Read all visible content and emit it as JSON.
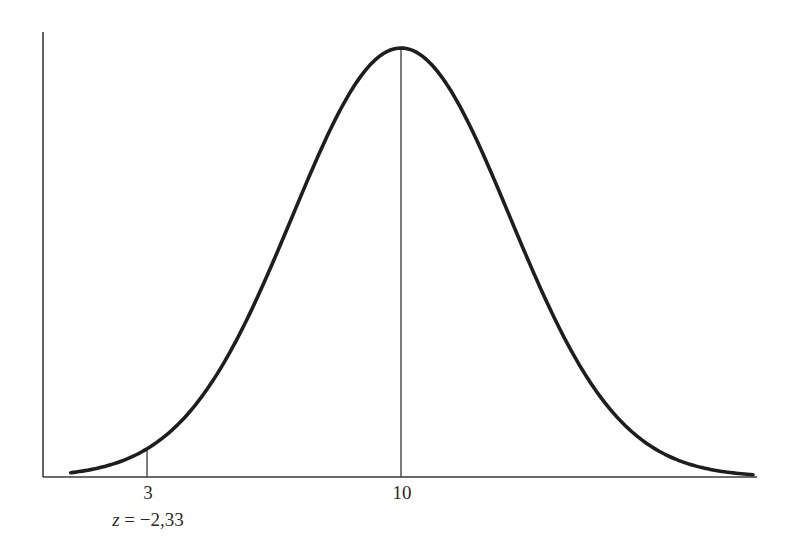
{
  "chart_data": {
    "type": "line",
    "title": "",
    "xlabel": "",
    "ylabel": "",
    "distribution": {
      "kind": "normal",
      "mean": 10,
      "std": 3
    },
    "xlim": [
      0.9,
      19.7
    ],
    "x_ticks": [
      {
        "value": 3,
        "label": "3"
      },
      {
        "value": 10,
        "label": "10"
      }
    ],
    "reference_lines": [
      {
        "x": 3,
        "label": "3",
        "annotation": "z = −2,33"
      },
      {
        "x": 10,
        "label": "10"
      }
    ],
    "annotations": [
      {
        "text": "z = −2,33",
        "at_x": 3,
        "position": "below tick label"
      }
    ],
    "grid": false,
    "legend": null
  },
  "labels": {
    "tick_3": "3",
    "tick_10": "10",
    "z_var": "z",
    "z_rest": " = −2,33"
  },
  "style": {
    "curve_color": "#1e1e1e",
    "axis_color": "#3a3a3a"
  }
}
